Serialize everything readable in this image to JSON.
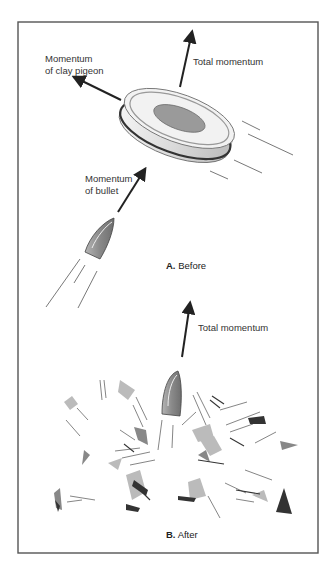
{
  "panel_a": {
    "caption_letter": "A.",
    "caption_text": "Before",
    "labels": {
      "clay_pigeon_line1": "Momentum",
      "clay_pigeon_line2": "of clay pigeon",
      "total": "Total momentum",
      "bullet_line1": "Momentum",
      "bullet_line2": "of bullet"
    }
  },
  "panel_b": {
    "caption_letter": "B.",
    "caption_text": "After",
    "labels": {
      "total": "Total momentum"
    }
  },
  "colors": {
    "frame": "#555555",
    "arrow": "#222222",
    "bullet": "#8a8a8a",
    "disc_center": "#9a9a9a",
    "disc_band": "#333333"
  }
}
